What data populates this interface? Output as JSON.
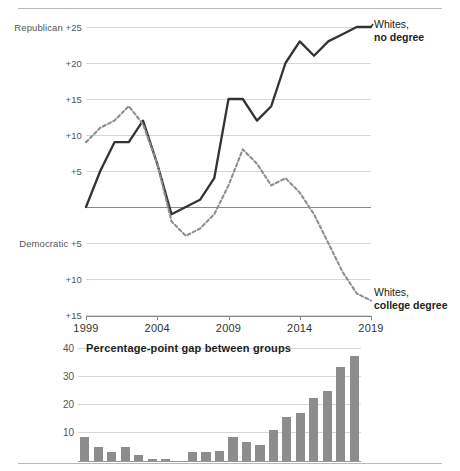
{
  "chart_data": [
    {
      "type": "line",
      "title": "",
      "xlabel": "",
      "ylabel": "",
      "axis_top_label": "Republican",
      "axis_bottom_label": "Democratic",
      "x": [
        1999,
        2000,
        2001,
        2002,
        2003,
        2004,
        2005,
        2006,
        2007,
        2008,
        2009,
        2010,
        2011,
        2012,
        2013,
        2014,
        2015,
        2016,
        2017,
        2018,
        2019
      ],
      "xticks": [
        "1999",
        "2004",
        "2009",
        "2014",
        "2019"
      ],
      "xtick_values": [
        1999,
        2004,
        2009,
        2014,
        2019
      ],
      "yticks": [
        "Republican +25",
        "+20",
        "+15",
        "+10",
        "+5",
        "",
        "Democratic +5",
        "+10",
        "+15"
      ],
      "ytick_values": [
        25,
        20,
        15,
        10,
        5,
        0,
        -5,
        -10,
        -15
      ],
      "ylim": [
        -15,
        25
      ],
      "grid": true,
      "legend_position": "right-annotations",
      "series": [
        {
          "name": "Whites, no degree",
          "style": "solid",
          "color": "#333333",
          "label_line1": "Whites,",
          "label_line2": "no degree",
          "values": [
            0,
            5,
            9,
            9,
            12,
            6,
            -1,
            0,
            1,
            4,
            15,
            15,
            12,
            14,
            20,
            23,
            21,
            23,
            24,
            25,
            25
          ]
        },
        {
          "name": "Whites, college degree",
          "style": "dashed",
          "color": "#8f8f8f",
          "label_line1": "Whites,",
          "label_line2": "college degree",
          "values": [
            9,
            11,
            12,
            14,
            11.5,
            6,
            -2,
            -4,
            -3,
            -1,
            3,
            8,
            6,
            3,
            4,
            2,
            -1,
            -5,
            -9,
            -12,
            -13
          ]
        }
      ]
    },
    {
      "type": "bar",
      "title": "Percentage-point gap between groups",
      "xlabel": "",
      "ylabel": "",
      "yticks": [
        "10",
        "20",
        "30",
        "40"
      ],
      "ytick_values": [
        10,
        20,
        30,
        40
      ],
      "ylim": [
        0,
        40
      ],
      "grid": true,
      "color": "#8d8d8d",
      "categories": [
        1999,
        2000,
        2001,
        2002,
        2003,
        2004,
        2005,
        2006,
        2007,
        2008,
        2009,
        2010,
        2011,
        2012,
        2013,
        2014,
        2015,
        2016,
        2017,
        2018,
        2019
      ],
      "values": [
        9,
        5.5,
        3.5,
        5.5,
        2.5,
        1,
        1,
        0,
        3.5,
        3.5,
        4,
        9,
        7,
        6,
        11.5,
        16,
        17.5,
        23,
        25.5,
        34,
        38
      ]
    }
  ],
  "figure": {
    "top_rule": true,
    "bottom_rule": true
  }
}
